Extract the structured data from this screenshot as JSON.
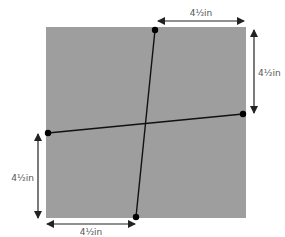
{
  "diagram": {
    "square": {
      "x": 46,
      "y": 27,
      "width": 200,
      "height": 191,
      "fill": "#9e9e9e"
    },
    "lines": [
      {
        "name": "vertical-cut-line",
        "x1": 155,
        "y1": 30,
        "x2": 136,
        "y2": 217
      },
      {
        "name": "horizontal-cut-line",
        "x1": 48,
        "y1": 133,
        "x2": 243,
        "y2": 114
      }
    ],
    "points": [
      {
        "name": "top-point",
        "x": 155,
        "y": 30
      },
      {
        "name": "bottom-point",
        "x": 136,
        "y": 217
      },
      {
        "name": "left-point",
        "x": 48,
        "y": 133
      },
      {
        "name": "right-point",
        "x": 243,
        "y": 114
      }
    ],
    "dimensions": {
      "top": {
        "label": "4½in"
      },
      "right": {
        "label": "4½in"
      },
      "left": {
        "label": "4½in"
      },
      "bottom": {
        "label": "4½in"
      }
    },
    "colors": {
      "line": "#111111",
      "arrow": "#222222",
      "label": "#555555"
    }
  }
}
